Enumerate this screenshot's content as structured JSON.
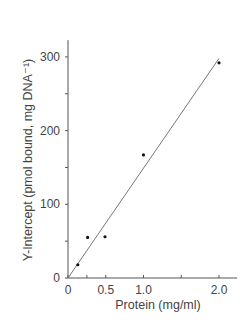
{
  "chart_data": {
    "type": "scatter",
    "title": "",
    "xlabel": "Protein (mg/ml)",
    "ylabel": "Y-Intercept (pmol bound, mg DNA⁻¹)",
    "xlim": [
      0,
      2.2
    ],
    "ylim": [
      0,
      320
    ],
    "x_ticks": [
      0,
      0.5,
      1.0,
      2.0
    ],
    "x_tick_labels": [
      "0",
      "0.5",
      "1.0",
      "2.0"
    ],
    "x_minor_ticks": [
      0.25,
      1.5
    ],
    "y_ticks": [
      0,
      100,
      200,
      300
    ],
    "y_tick_labels": [
      "0",
      "100",
      "200",
      "300"
    ],
    "y_minor_ticks": [
      50,
      150,
      250
    ],
    "grid": false,
    "legend": null,
    "series": [
      {
        "name": "data",
        "type": "scatter",
        "x": [
          0.13,
          0.26,
          0.49,
          1.0,
          2.0
        ],
        "y": [
          18,
          55,
          56,
          167,
          292
        ]
      },
      {
        "name": "fit",
        "type": "line",
        "x": [
          0,
          2.0
        ],
        "y": [
          0,
          298
        ]
      }
    ]
  }
}
